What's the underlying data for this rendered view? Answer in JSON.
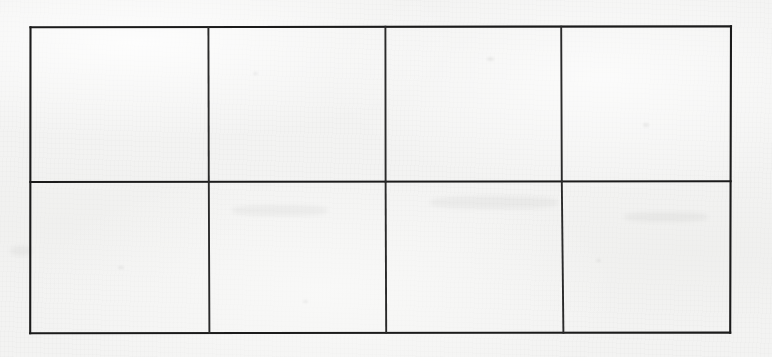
{
  "document": {
    "kind": "scanned-paper",
    "background_color": "#f2f2f2",
    "ink_color": "#1b1b1b",
    "width": 772,
    "height": 357
  },
  "table": {
    "name": "empty-grid-table",
    "columns": 4,
    "rows": 2,
    "has_header_row": false,
    "border_color": "#1b1b1b",
    "border_width_px": 2,
    "bounds": {
      "left": 30,
      "top": 27,
      "right": 731,
      "bottom": 333
    },
    "column_dividers_x": [
      208,
      385,
      561
    ],
    "row_dividers_y": [
      182
    ],
    "column_headers": [
      "",
      "",
      "",
      ""
    ],
    "cells": [
      [
        "",
        "",
        "",
        ""
      ],
      [
        "",
        "",
        "",
        ""
      ]
    ]
  }
}
